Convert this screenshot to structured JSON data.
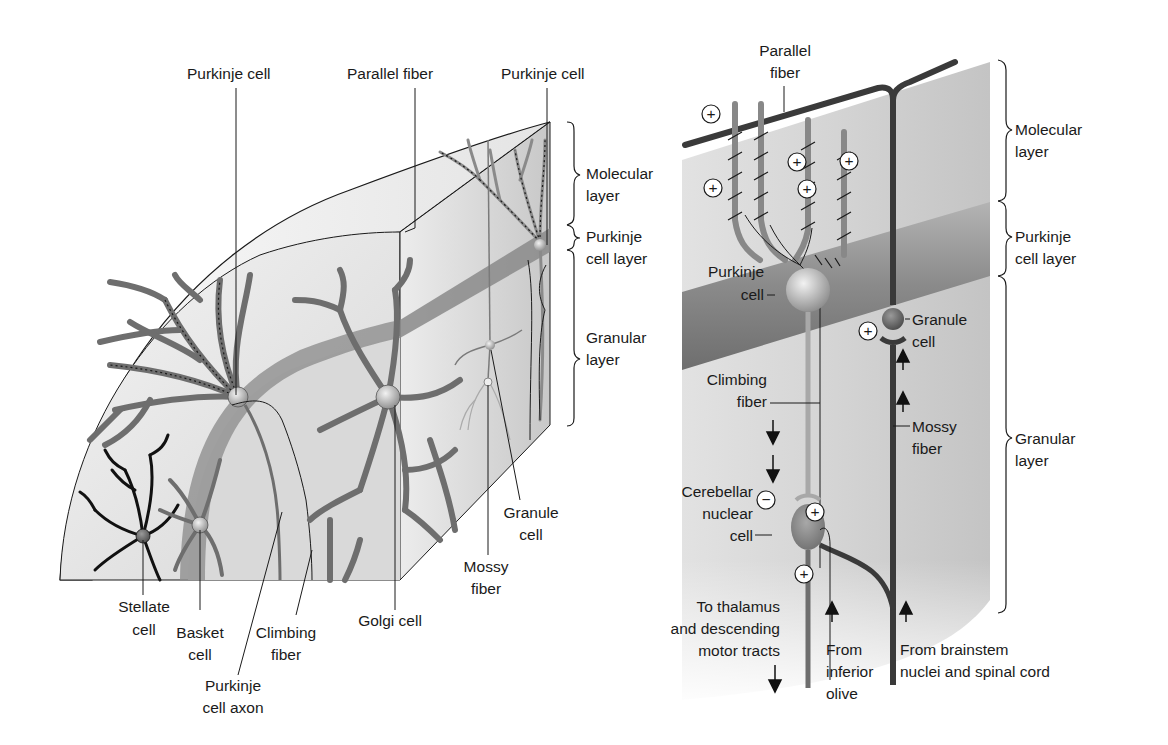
{
  "figure": {
    "left_panel": {
      "title": "Cerebellar cortex 3D block",
      "top_labels": {
        "purkinje_cell_a": "Purkinje cell",
        "parallel_fiber": "Parallel fiber",
        "purkinje_cell_b": "Purkinje cell"
      },
      "layer_labels": {
        "molecular_1": "Molecular",
        "molecular_2": "layer",
        "purkinje_1": "Purkinje",
        "purkinje_2": "cell layer",
        "granular_1": "Granular",
        "granular_2": "layer"
      },
      "bottom_labels": {
        "stellate_1": "Stellate",
        "stellate_2": "cell",
        "basket_1": "Basket",
        "basket_2": "cell",
        "climbing_1": "Climbing",
        "climbing_2": "fiber",
        "axon_1": "Purkinje",
        "axon_2": "cell axon",
        "golgi": "Golgi cell",
        "mossy_1": "Mossy",
        "mossy_2": "fiber",
        "granule_1": "Granule",
        "granule_2": "cell"
      }
    },
    "right_panel": {
      "title": "Cerebellar circuit",
      "labels": {
        "parallel_1": "Parallel",
        "parallel_2": "fiber",
        "purkinje_1": "Purkinje",
        "purkinje_2": "cell",
        "granule_1": "Granule",
        "granule_2": "cell",
        "climbing_1": "Climbing",
        "climbing_2": "fiber",
        "mossy_1": "Mossy",
        "mossy_2": "fiber",
        "cerebellar_1": "Cerebellar",
        "cerebellar_2": "nuclear",
        "cerebellar_3": "cell",
        "thalamus_1": "To thalamus",
        "thalamus_2": "and descending",
        "thalamus_3": "motor tracts",
        "olive_1": "From",
        "olive_2": "inferior",
        "olive_3": "olive",
        "brainstem_1": "From brainstem",
        "brainstem_2": "nuclei and spinal cord"
      },
      "layer_labels": {
        "molecular_1": "Molecular",
        "molecular_2": "layer",
        "purkinje_1": "Purkinje",
        "purkinje_2": "cell layer",
        "granular_1": "Granular",
        "granular_2": "layer"
      },
      "synapse_signs": {
        "excitatory": "+",
        "inhibitory": "−"
      }
    },
    "colors": {
      "background": "#ffffff",
      "tissue_light": "#e8e8e8",
      "tissue_mid": "#cfcfcf",
      "purkinje_band": "#8f8f8f",
      "dendrite": "#6e6e6e",
      "fiber_dark": "#3a3a3a",
      "ink": "#1a1a1a"
    }
  }
}
